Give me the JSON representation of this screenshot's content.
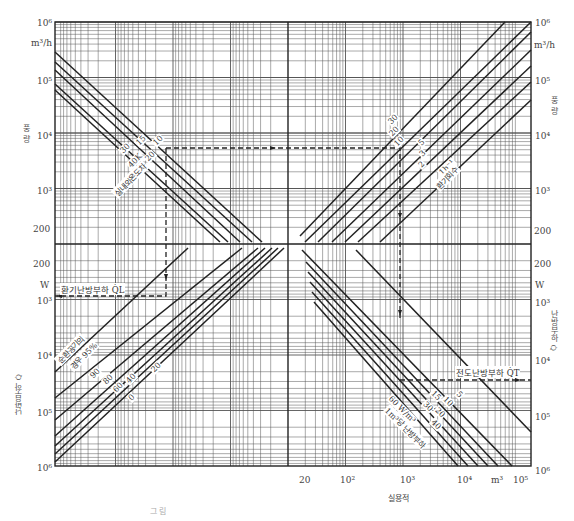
{
  "chart_data": {
    "type": "line",
    "title": "",
    "plot_area": {
      "left": 55,
      "top": 22,
      "right": 531,
      "bottom": 466
    },
    "axes": {
      "left_top": {
        "label": "풍 량",
        "unit": "m³/h",
        "ticks": [
          "10⁶",
          "10⁵",
          "10⁴",
          "10³",
          "200"
        ]
      },
      "left_bottom": {
        "label": "난방부하 Q̇",
        "unit": "W",
        "ticks": [
          "200",
          "10³",
          "10⁴",
          "10⁵",
          "10⁶"
        ]
      },
      "right_top": {
        "label": "풍 량",
        "unit": "m³/h",
        "ticks": [
          "10⁶",
          "10⁵",
          "10⁴",
          "10³",
          "200"
        ]
      },
      "right_bottom": {
        "label": "난방부하 Q̇",
        "unit": "W",
        "ticks": [
          "200",
          "10³",
          "10⁴",
          "10⁵",
          "10⁶"
        ]
      },
      "bottom": {
        "label": "실용적",
        "unit": "m³",
        "ticks": [
          "20",
          "10²",
          "10³",
          "10⁴",
          "10⁵"
        ]
      }
    },
    "quadrants": {
      "top_left": {
        "name": "실내외온도차",
        "series_labels": [
          "15",
          "10",
          "20",
          "30",
          "40K"
        ],
        "annotation": "실내외온도차"
      },
      "top_right": {
        "name": "환기회수",
        "series_labels": [
          "30",
          "20",
          "10",
          "5",
          "3",
          "2",
          "1h⁻¹"
        ],
        "annotation": "환기회수"
      },
      "bottom_left": {
        "name": "순환공기의 경우",
        "series_labels": [
          "95%",
          "90",
          "80",
          "60",
          "40",
          "20",
          "0"
        ],
        "annotation": "순환공기의 경우 95%",
        "load_label": "환기난방부하 Q̇L"
      },
      "bottom_right": {
        "name": "1m³당 난방부하",
        "series_labels": [
          "5",
          "10",
          "15",
          "20",
          "30",
          "40",
          "60 W/m³"
        ],
        "annotation": "1m³당 난방부하",
        "load_label": "전도난방부하 Q̇T"
      }
    },
    "example_path": {
      "style": "dashed",
      "description": "Example reading path: from volume up to ventilation rate, across to temperature difference, down to ventilation heating load; and from volume down to conduction heating load"
    }
  },
  "labels": {
    "tl_unit_top": "10⁶",
    "tl_unit": "m³/h",
    "tl_1e5": "10⁵",
    "tl_1e4": "10⁴",
    "tl_1e3": "10³",
    "tl_200a": "200",
    "tl_200b": "200",
    "l_W": "W",
    "l_1e3": "10³",
    "l_1e4": "10⁴",
    "l_1e5": "10⁵",
    "l_1e6": "10⁶",
    "r_unit_top": "10⁶",
    "r_unit": "m³/h",
    "r_1e5": "10⁵",
    "r_1e4": "10⁴",
    "r_1e3": "10³",
    "r_200a": "200",
    "r_200b": "200",
    "r_W": "W",
    "r_b1e3": "10³",
    "r_b1e4": "10⁴",
    "r_b1e5": "10⁵",
    "r_b1e6": "10⁶",
    "b_20": "20",
    "b_1e2": "10²",
    "b_1e3": "10³",
    "b_1e4": "10⁴",
    "b_m3": "m³",
    "b_1e5": "10⁵",
    "x_title": "실용적",
    "left_flow_title": "풍 량",
    "right_flow_title": "풍 량",
    "left_load_title": "난방부하 Q̇",
    "right_load_title": "난방부하 Q̇",
    "ql_label": "환기난방부하 Q̇L",
    "qt_label": "전도난방부하 Q̇T",
    "tl_ann": "실내외온도차",
    "tl_s15": "15",
    "tl_s10": "10",
    "tl_s20": "20",
    "tl_s30": "30",
    "tl_s40": "40K",
    "tr_ann": "환기회수",
    "tr_s30": "30",
    "tr_s20": "20",
    "tr_s10": "10",
    "tr_s5": "5",
    "tr_s3": "3",
    "tr_s2": "2",
    "tr_s1": "1h⁻¹",
    "bl_ann1": "순환공기의",
    "bl_ann2": "경우 95%",
    "bl_s90": "90",
    "bl_s80": "80",
    "bl_s60": "60",
    "bl_s40": "40",
    "bl_s20": "20",
    "bl_s0": "0",
    "br_s5": "5",
    "br_s15": "15",
    "br_s10": "10",
    "br_s30": "30",
    "br_s20": "20",
    "br_s40": "40",
    "br_s60": "60 W/m³",
    "br_ann": "1m³당 난방부하",
    "caption": "그림"
  }
}
